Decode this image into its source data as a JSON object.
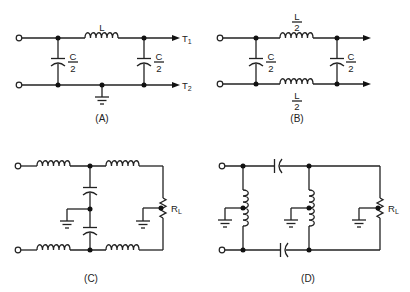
{
  "figure": {
    "panels": [
      {
        "id": "A",
        "caption": "(A)",
        "inductor_label": "L",
        "cap_left": {
          "num": "C",
          "den": "2"
        },
        "cap_right": {
          "num": "C",
          "den": "2"
        },
        "terminal_top": "T",
        "terminal_top_sub": "1",
        "terminal_bottom": "T",
        "terminal_bottom_sub": "2"
      },
      {
        "id": "B",
        "caption": "(B)",
        "inductor_top": {
          "num": "L",
          "den": "2"
        },
        "inductor_bottom": {
          "num": "L",
          "den": "2"
        },
        "cap_left": {
          "num": "C",
          "den": "2"
        },
        "cap_right": {
          "num": "C",
          "den": "2"
        }
      },
      {
        "id": "C",
        "caption": "(C)",
        "load_label": "R",
        "load_sub": "L"
      },
      {
        "id": "D",
        "caption": "(D)",
        "load_label": "R",
        "load_sub": "L"
      }
    ]
  }
}
